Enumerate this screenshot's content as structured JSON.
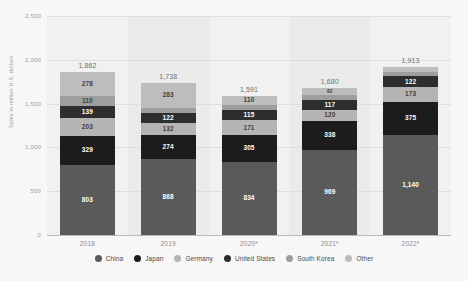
{
  "chart_data": {
    "type": "bar",
    "subtype": "stacked-bar",
    "title": "",
    "xlabel": "",
    "ylabel": "Sales in million U.S. dollars",
    "categories": [
      "2018",
      "2019",
      "2020*",
      "2021*",
      "2022*"
    ],
    "ylim": [
      0,
      2500
    ],
    "yticks": [
      "0",
      "500",
      "1,000",
      "1,500",
      "2,000",
      "2,500"
    ],
    "ytick_values": [
      0,
      500,
      1000,
      1500,
      2000,
      2500
    ],
    "grid": true,
    "legend_position": "bottom",
    "totals": [
      "1,862",
      "1,738",
      "1,591",
      "1,680",
      "1,913"
    ],
    "total_values": [
      1862,
      1738,
      1591,
      1680,
      1913
    ],
    "series": [
      {
        "name": "China",
        "color": "#5a5a5a",
        "values": [
          803,
          868,
          834,
          969,
          1140
        ],
        "labels": [
          "803",
          "868",
          "834",
          "969",
          "1,140"
        ]
      },
      {
        "name": "Japan",
        "color": "#1c1c1c",
        "values": [
          329,
          274,
          305,
          338,
          375
        ],
        "labels": [
          "329",
          "274",
          "305",
          "338",
          "375"
        ]
      },
      {
        "name": "Germany",
        "color": "#b4b4b4",
        "values": [
          203,
          132,
          171,
          120,
          173
        ],
        "labels": [
          "203",
          "132",
          "171",
          "120",
          "173"
        ]
      },
      {
        "name": "United States",
        "color": "#2e2e2e",
        "values": [
          139,
          122,
          115,
          117,
          122
        ],
        "labels": [
          "139",
          "122",
          "115",
          "117",
          "122"
        ]
      },
      {
        "name": "South Korea",
        "color": "#9e9e9e",
        "values": [
          110,
          59,
          56,
          54,
          51
        ],
        "labels": [
          "110",
          "59",
          "56",
          "54",
          "51"
        ]
      },
      {
        "name": "Other",
        "color": "#bdbdbd",
        "values": [
          278,
          283,
          110,
          82,
          52
        ],
        "labels": [
          "278",
          "283",
          "110",
          "82",
          "52"
        ]
      }
    ]
  }
}
